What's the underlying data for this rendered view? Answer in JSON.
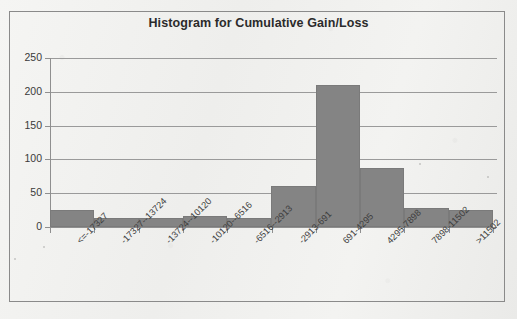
{
  "chart_data": {
    "type": "bar",
    "title": "Histogram for Cumulative Gain/Loss",
    "xlabel": "",
    "ylabel": "",
    "ylim": [
      0,
      250
    ],
    "yticks": [
      0,
      50,
      100,
      150,
      200,
      250
    ],
    "grid": true,
    "legend": null,
    "bar_color": "#848484",
    "categories": [
      "<=-17327",
      "-17327--13724",
      "-13724--10120",
      "-10120--6516",
      "-6516--2913",
      "-2913-691",
      "691-4295",
      "4295-7898",
      "7898-11502",
      ">11502"
    ],
    "values": [
      25,
      13,
      13,
      17,
      14,
      60,
      210,
      87,
      28,
      25
    ]
  },
  "frame": {
    "border_color": "#8a8a8a"
  }
}
